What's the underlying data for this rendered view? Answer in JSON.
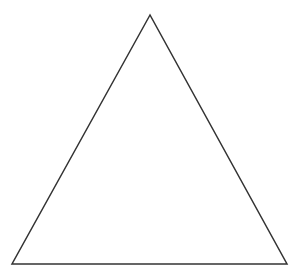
{
  "diagram": {
    "shape": "triangle",
    "vertices": {
      "apex": [
        150,
        15
      ],
      "bottom_left": [
        12,
        264
      ],
      "bottom_right": [
        287,
        264
      ]
    },
    "stroke_color": "#333333",
    "stroke_width": 1.5,
    "fill": "none",
    "background": "#ffffff"
  }
}
